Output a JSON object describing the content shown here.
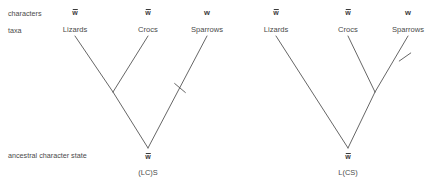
{
  "figure": {
    "width": 438,
    "height": 188,
    "background": "#ffffff",
    "line_color": "#555555"
  },
  "row_labels": {
    "characters": "characters",
    "taxa": "taxa",
    "ancestral": "ancestral character state"
  },
  "glyphs": {
    "w_bar": "w",
    "w_plain": "w",
    "macron": true
  },
  "trees": [
    {
      "id": "left-tree",
      "name": "(LC)S",
      "name_x": 148,
      "name_y": 172,
      "root": {
        "x": 148,
        "y": 148,
        "state": "w",
        "state_macron": true,
        "state_x": 148,
        "state_y": 155
      },
      "internal_nodes": [
        {
          "id": "lizards-crocs-node",
          "x": 113,
          "y": 92
        }
      ],
      "leaves": [
        {
          "id": "lizards",
          "label": "Lizards",
          "x": 75,
          "y": 31,
          "char": "w",
          "char_macron": true,
          "char_y": 13
        },
        {
          "id": "crocs",
          "label": "Crocs",
          "x": 148,
          "y": 31,
          "char": "w",
          "char_macron": true,
          "char_y": 13
        },
        {
          "id": "sparrows",
          "label": "Sparrows",
          "x": 207,
          "y": 31,
          "char": "w",
          "char_macron": false,
          "char_y": 13
        }
      ],
      "branches": [
        {
          "id": "lizards-branch",
          "x1": 75,
          "y1": 36,
          "x2": 113,
          "y2": 92
        },
        {
          "id": "crocs-branch",
          "x1": 148,
          "y1": 36,
          "x2": 113,
          "y2": 92
        },
        {
          "id": "internal-to-root-branch",
          "x1": 113,
          "y1": 92,
          "x2": 148,
          "y2": 148
        },
        {
          "id": "sparrows-branch",
          "x1": 207,
          "y1": 36,
          "x2": 148,
          "y2": 148
        }
      ],
      "change_marks": [
        {
          "id": "sparrows-change-mark",
          "x": 180,
          "y": 88,
          "angle": 40
        }
      ]
    },
    {
      "id": "right-tree",
      "name": "L(CS)",
      "name_x": 348,
      "name_y": 172,
      "root": {
        "x": 348,
        "y": 148,
        "state": "w",
        "state_macron": true,
        "state_x": 348,
        "state_y": 155
      },
      "internal_nodes": [
        {
          "id": "crocs-sparrows-node",
          "x": 375,
          "y": 92
        }
      ],
      "leaves": [
        {
          "id": "lizards",
          "label": "Lizards",
          "x": 276,
          "y": 31,
          "char": "w",
          "char_macron": true,
          "char_y": 13
        },
        {
          "id": "crocs",
          "label": "Crocs",
          "x": 348,
          "y": 31,
          "char": "w",
          "char_macron": true,
          "char_y": 13
        },
        {
          "id": "sparrows",
          "label": "Sparrows",
          "x": 408,
          "y": 31,
          "char": "w",
          "char_macron": false,
          "char_y": 13
        }
      ],
      "branches": [
        {
          "id": "crocs-branch",
          "x1": 348,
          "y1": 36,
          "x2": 375,
          "y2": 92
        },
        {
          "id": "sparrows-branch",
          "x1": 408,
          "y1": 36,
          "x2": 375,
          "y2": 92
        },
        {
          "id": "internal-to-root-branch",
          "x1": 375,
          "y1": 92,
          "x2": 348,
          "y2": 148
        },
        {
          "id": "lizards-branch",
          "x1": 276,
          "y1": 36,
          "x2": 348,
          "y2": 148
        }
      ],
      "change_marks": [
        {
          "id": "sparrows-change-mark",
          "x": 405,
          "y": 57,
          "angle": -35
        }
      ]
    }
  ],
  "positions": {
    "characters_label": {
      "x": 8,
      "y": 10
    },
    "taxa_label": {
      "x": 8,
      "y": 27
    },
    "ancestral_label": {
      "x": 8,
      "y": 152
    }
  }
}
